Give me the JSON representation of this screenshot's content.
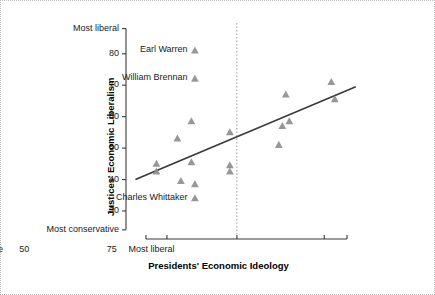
{
  "chart_data": {
    "type": "scatter",
    "title": "",
    "xlabel": "Presidents' Economic Ideology",
    "ylabel": "Justices' Economic Liberalism",
    "xlim": [
      20,
      85
    ],
    "ylim": [
      24,
      88
    ],
    "grid": false,
    "legend": "none",
    "x_ticks": [
      30,
      50,
      75
    ],
    "x_tick_labels": [
      "30",
      "50",
      "75"
    ],
    "x_end_labels": {
      "left": "Most conservative",
      "right": "Most liberal"
    },
    "y_ticks": [
      30,
      40,
      50,
      60,
      70,
      80
    ],
    "y_tick_labels": [
      "30",
      "40",
      "50",
      "60",
      "70",
      "80"
    ],
    "y_end_labels": {
      "top": "Most liberal",
      "bottom": "Most conservative"
    },
    "marker": "triangle",
    "marker_color": "#8c8c8c",
    "line_color": "#3a3a3a",
    "reference_line": {
      "x": 50,
      "style": "dotted",
      "color": "#9a9a9a"
    },
    "trend_line": {
      "x": [
        21,
        84
      ],
      "y": [
        40.0,
        69.5
      ]
    },
    "points": [
      {
        "x": 27.0,
        "y": 45.0,
        "label": ""
      },
      {
        "x": 27.0,
        "y": 42.5,
        "label": ""
      },
      {
        "x": 33.0,
        "y": 53.0,
        "label": ""
      },
      {
        "x": 34.0,
        "y": 39.5,
        "label": ""
      },
      {
        "x": 37.0,
        "y": 58.5,
        "label": ""
      },
      {
        "x": 37.0,
        "y": 45.5,
        "label": ""
      },
      {
        "x": 38.0,
        "y": 38.5,
        "label": ""
      },
      {
        "x": 38.0,
        "y": 81.0,
        "label": "Earl Warren"
      },
      {
        "x": 38.0,
        "y": 72.0,
        "label": "William Brennan"
      },
      {
        "x": 38.0,
        "y": 34.0,
        "label": "Charles Whittaker"
      },
      {
        "x": 48.0,
        "y": 55.0,
        "label": ""
      },
      {
        "x": 48.0,
        "y": 44.5,
        "label": ""
      },
      {
        "x": 48.0,
        "y": 42.5,
        "label": ""
      },
      {
        "x": 62.0,
        "y": 51.0,
        "label": ""
      },
      {
        "x": 63.0,
        "y": 57.0,
        "label": ""
      },
      {
        "x": 64.0,
        "y": 67.0,
        "label": ""
      },
      {
        "x": 65.0,
        "y": 58.5,
        "label": ""
      },
      {
        "x": 77.0,
        "y": 71.0,
        "label": ""
      },
      {
        "x": 78.0,
        "y": 65.5,
        "label": ""
      }
    ],
    "annotations": [
      {
        "text": "Earl Warren",
        "x": 38.0,
        "y": 81.0
      },
      {
        "text": "William Brennan",
        "x": 38.0,
        "y": 72.0
      },
      {
        "text": "Charles Whittaker",
        "x": 38.0,
        "y": 34.0
      }
    ]
  }
}
